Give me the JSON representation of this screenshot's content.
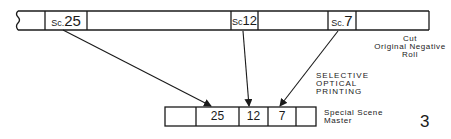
{
  "diagram": {
    "source_strip": {
      "label_lines": [
        "Cut",
        "Original Negative",
        "Roll"
      ],
      "scenes": [
        {
          "prefix": "Sc.",
          "number": "25"
        },
        {
          "prefix": "Sc",
          "number": "12"
        },
        {
          "prefix": "Sc.",
          "number": "7"
        }
      ]
    },
    "process_label_lines": [
      "SELECTIVE",
      "OPTICAL",
      "PRINTING"
    ],
    "target_strip": {
      "label_lines": [
        "Special Scene",
        "Master"
      ],
      "cells": [
        "",
        "25",
        "12",
        "7",
        ""
      ]
    },
    "figure_number": "3",
    "colors": {
      "ink": "#1a1a1a",
      "background": "#ffffff"
    }
  }
}
